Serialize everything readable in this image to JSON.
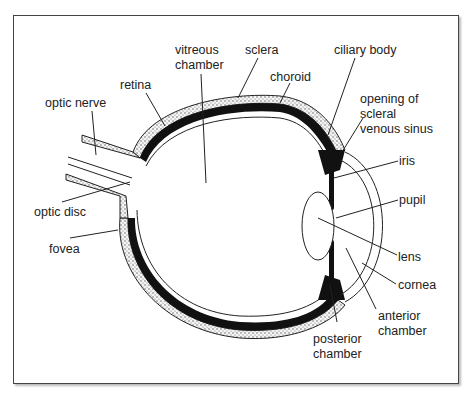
{
  "diagram": {
    "labels": {
      "vitreous_chamber_1": "vitreous",
      "vitreous_chamber_2": "chamber",
      "sclera": "sclera",
      "ciliary_body": "ciliary body",
      "retina": "retina",
      "choroid": "choroid",
      "optic_nerve": "optic nerve",
      "opening_1": "opening of",
      "opening_2": "scleral",
      "opening_3": "venous sinus",
      "iris": "iris",
      "pupil": "pupil",
      "optic_disc": "optic disc",
      "fovea": "fovea",
      "lens": "lens",
      "cornea": "cornea",
      "anterior_1": "anterior",
      "anterior_2": "chamber",
      "posterior_1": "posterior",
      "posterior_2": "chamber"
    },
    "colors": {
      "line": "#222222",
      "frame": "#444444",
      "sclera_fill": "#e8e8e8"
    }
  }
}
